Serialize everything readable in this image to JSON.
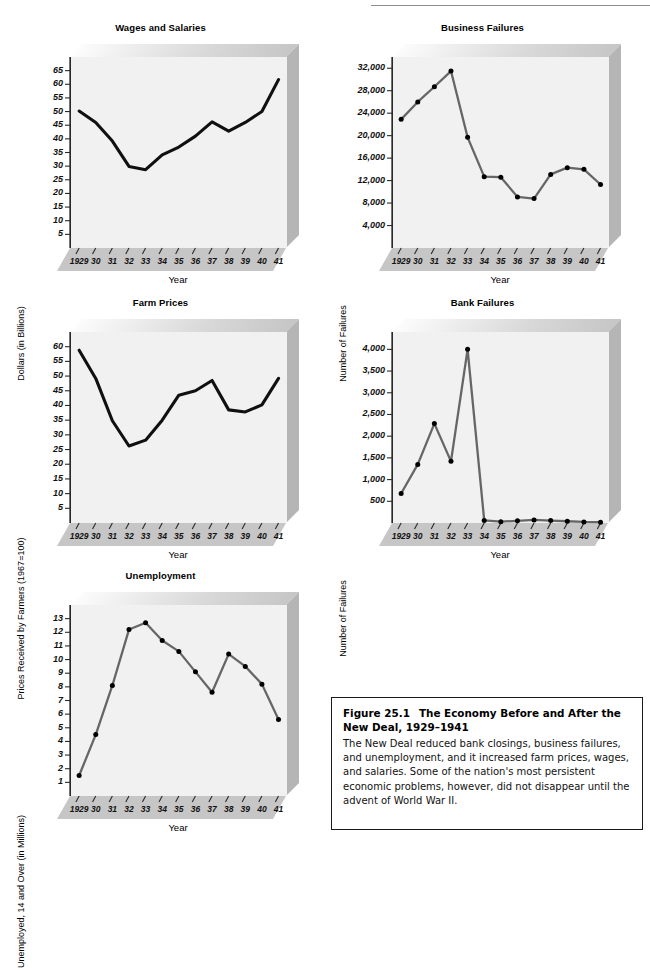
{
  "figure": {
    "label": "Figure 25.1",
    "title": "The Economy Before and After the New Deal, 1929–1941",
    "body": "The New Deal reduced bank closings, business failures, and unemployment, and it increased farm prices, wages, and salaries. Some of the nation's most persistent economic problems, however, did not disappear until the advent of World War II."
  },
  "colors": {
    "plot_face": "#f1f1f1",
    "panel_side": "#b9b9b9",
    "panel_base": "#c9c9c9",
    "line_black": "#101010",
    "line_gray": "#666666",
    "marker": "#000000",
    "axis": "#2a2a2a"
  },
  "years": [
    "1929",
    "30",
    "31",
    "32",
    "33",
    "34",
    "35",
    "36",
    "37",
    "38",
    "39",
    "40",
    "41"
  ],
  "chart_data": [
    {
      "id": "wages",
      "type": "line",
      "title": "Wages and Salaries",
      "xlabel": "Year",
      "ylabel": "Dollars (in Billions)",
      "categories": [
        "1929",
        "30",
        "31",
        "32",
        "33",
        "34",
        "35",
        "36",
        "37",
        "38",
        "39",
        "40",
        "41"
      ],
      "yticks": [
        5,
        10,
        15,
        20,
        25,
        30,
        35,
        40,
        45,
        50,
        55,
        60,
        65
      ],
      "ylim": [
        0,
        70
      ],
      "grid": false,
      "markers": false,
      "line_color": "#101010",
      "values": [
        50.2,
        46.0,
        39.2,
        29.9,
        28.7,
        34.1,
        37.0,
        41.0,
        46.2,
        42.8,
        46.0,
        50.0,
        61.7
      ]
    },
    {
      "id": "business-failures",
      "type": "line",
      "title": "Business Failures",
      "xlabel": "Year",
      "ylabel": "Number of Failures",
      "categories": [
        "1929",
        "30",
        "31",
        "32",
        "33",
        "34",
        "35",
        "36",
        "37",
        "38",
        "39",
        "40",
        "41"
      ],
      "yticks": [
        4000,
        8000,
        12000,
        16000,
        20000,
        24000,
        28000,
        32000
      ],
      "yticklabels": [
        "4,000",
        "8,000",
        "12,000",
        "16,000",
        "20,000",
        "24,000",
        "28,000",
        "32,000"
      ],
      "ylim": [
        0,
        34000
      ],
      "grid": false,
      "markers": true,
      "line_color": "#666666",
      "values": [
        22900,
        26000,
        28700,
        31500,
        19700,
        12700,
        12600,
        9100,
        8800,
        13100,
        14300,
        14000,
        11300
      ]
    },
    {
      "id": "farm-prices",
      "type": "line",
      "title": "Farm Prices",
      "xlabel": "Year",
      "ylabel": "Prices Received by Farmers (1967=100)",
      "categories": [
        "1929",
        "30",
        "31",
        "32",
        "33",
        "34",
        "35",
        "36",
        "37",
        "38",
        "39",
        "40",
        "41"
      ],
      "yticks": [
        5,
        10,
        15,
        20,
        25,
        30,
        35,
        40,
        45,
        50,
        55,
        60
      ],
      "ylim": [
        0,
        65
      ],
      "grid": false,
      "markers": false,
      "line_color": "#101010",
      "values": [
        58.8,
        49.2,
        34.8,
        26.2,
        28.2,
        35.0,
        43.5,
        45.0,
        48.5,
        38.5,
        37.8,
        40.2,
        49.2
      ]
    },
    {
      "id": "bank-failures",
      "type": "line",
      "title": "Bank Failures",
      "xlabel": "Year",
      "ylabel": "Number of Failures",
      "categories": [
        "1929",
        "30",
        "31",
        "32",
        "33",
        "34",
        "35",
        "36",
        "37",
        "38",
        "39",
        "40",
        "41"
      ],
      "yticks": [
        500,
        1000,
        1500,
        2000,
        2500,
        3000,
        3500,
        4000
      ],
      "yticklabels": [
        "500",
        "1,000",
        "1,500",
        "2,000",
        "2,500",
        "3,000",
        "3,500",
        "4,000"
      ],
      "ylim": [
        0,
        4400
      ],
      "grid": false,
      "markers": true,
      "line_color": "#666666",
      "values": [
        680,
        1350,
        2290,
        1420,
        4000,
        60,
        30,
        50,
        70,
        55,
        40,
        25,
        20
      ]
    },
    {
      "id": "unemployment",
      "type": "line",
      "title": "Unemployment",
      "xlabel": "Year",
      "ylabel": "Unemployed, 14 and Over (in Millions)",
      "categories": [
        "1929",
        "30",
        "31",
        "32",
        "33",
        "34",
        "35",
        "36",
        "37",
        "38",
        "39",
        "40",
        "41"
      ],
      "yticks": [
        1,
        2,
        3,
        4,
        5,
        6,
        7,
        8,
        9,
        10,
        11,
        12,
        13
      ],
      "ylim": [
        0,
        14
      ],
      "grid": false,
      "markers": true,
      "line_color": "#666666",
      "values": [
        1.5,
        4.5,
        8.1,
        12.2,
        12.7,
        11.4,
        10.6,
        9.1,
        7.6,
        10.4,
        9.5,
        8.2,
        5.6
      ]
    }
  ]
}
